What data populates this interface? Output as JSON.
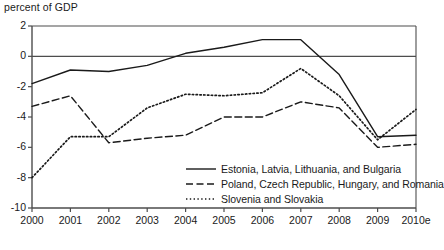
{
  "chart_data": {
    "type": "line",
    "title": "percent of GDP",
    "xlabel": "",
    "ylabel": "percent of GDP",
    "grid": false,
    "zero_line": true,
    "legend_position": "inside-bottom-right",
    "x": [
      "2000",
      "2001",
      "2002",
      "2003",
      "2004",
      "2005",
      "2006",
      "2007",
      "2008",
      "2009",
      "2010e"
    ],
    "xlim_labels": [
      "2000",
      "2010e"
    ],
    "ylim": [
      -10,
      2
    ],
    "yticks": [
      2,
      0,
      -2,
      -4,
      -6,
      -8,
      -10
    ],
    "ytick_labels": [
      "2",
      "0",
      "-2",
      "-4",
      "-6",
      "-8",
      "-10"
    ],
    "series": [
      {
        "name": "Estonia, Latvia, Lithuania, and Bulgaria",
        "style": "solid",
        "values": [
          -1.8,
          -0.9,
          -1.0,
          -0.6,
          0.2,
          0.6,
          1.1,
          1.1,
          -1.2,
          -5.3,
          -5.2
        ]
      },
      {
        "name": "Poland, Czech Republic, Hungary, and Romania",
        "style": "dashed",
        "values": [
          -3.3,
          -2.6,
          -5.7,
          -5.4,
          -5.2,
          -4.0,
          -4.0,
          -3.0,
          -3.4,
          -6.0,
          -5.8
        ]
      },
      {
        "name": "Slovenia and Slovakia",
        "style": "dotted",
        "values": [
          -8.0,
          -5.3,
          -5.3,
          -3.4,
          -2.5,
          -2.6,
          -2.4,
          -0.8,
          -2.6,
          -5.5,
          -3.5
        ]
      }
    ]
  },
  "legend": {
    "items": [
      {
        "label": "Estonia, Latvia, Lithuania, and Bulgaria",
        "style": "solid"
      },
      {
        "label": "Poland, Czech Republic, Hungary, and Romania",
        "style": "dashed"
      },
      {
        "label": "Slovenia and Slovakia",
        "style": "dotted"
      }
    ]
  },
  "axes": {
    "y_labels": [
      "2",
      "0",
      "-2",
      "-4",
      "-6",
      "-8",
      "-10"
    ],
    "x_labels": [
      "2000",
      "2001",
      "2002",
      "2003",
      "2004",
      "2005",
      "2006",
      "2007",
      "2008",
      "2009",
      "2010e"
    ]
  },
  "colors": {
    "line": "#1a1a1a",
    "axis": "#4d4d4d",
    "background": "#ffffff"
  }
}
